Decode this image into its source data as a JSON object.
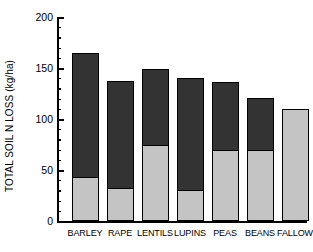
{
  "chart_data": {
    "type": "bar",
    "stacked": true,
    "title": "",
    "xlabel": "",
    "ylabel": "TOTAL SOIL N LOSS (kg/ha)",
    "categories": [
      "BARLEY",
      "RAPE",
      "LENTILS",
      "LUPINS",
      "PEAS",
      "BEANS",
      "FALLOW"
    ],
    "series": [
      {
        "name": "lower-segment",
        "color": "#c4c4c4",
        "values": [
          43,
          32,
          75,
          30,
          70,
          70,
          110
        ]
      },
      {
        "name": "upper-segment",
        "color": "#333333",
        "values": [
          122,
          105,
          74,
          110,
          66,
          51,
          0
        ]
      }
    ],
    "totals": [
      165,
      137,
      149,
      140,
      136,
      121,
      110
    ],
    "ylim": [
      0,
      200
    ],
    "y_major_ticks": [
      0,
      50,
      100,
      150,
      200
    ],
    "y_tick_labels": [
      "0",
      "50",
      "100",
      "150",
      "200"
    ],
    "y_minor_tick_interval": 10,
    "grid": false,
    "legend": "none"
  }
}
